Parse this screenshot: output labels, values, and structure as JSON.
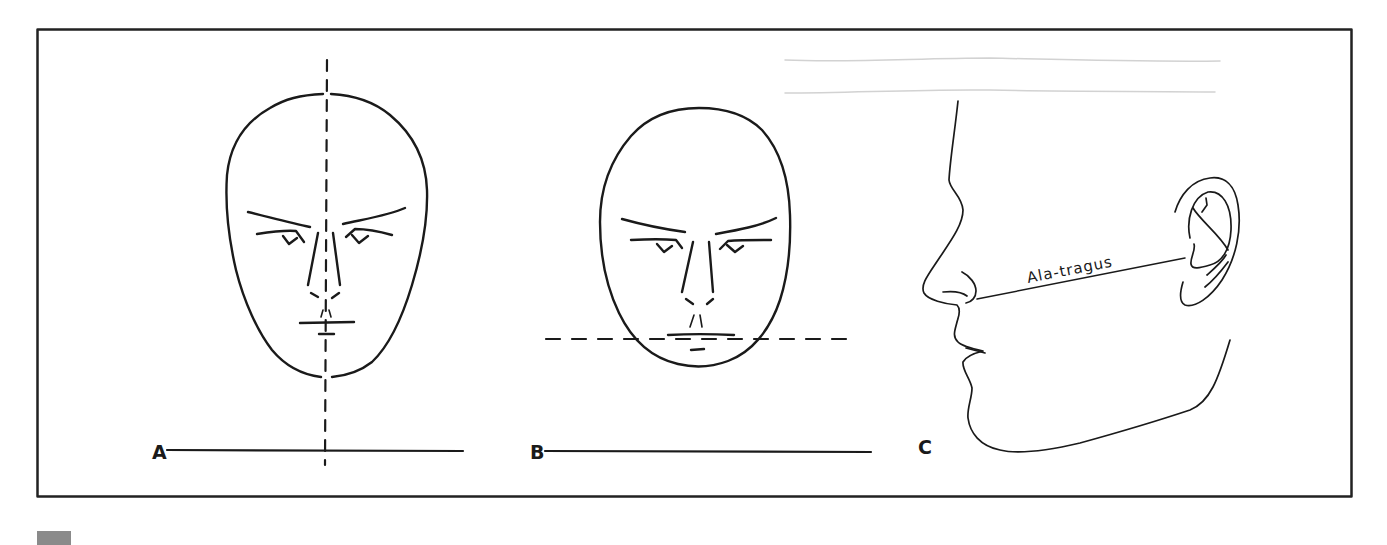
{
  "figure": {
    "panels": [
      {
        "id": "A",
        "label": "A",
        "description": "Frontal view of face with vertical dashed midline (facial midline)",
        "reference_line": "vertical dashed midline"
      },
      {
        "id": "B",
        "label": "B",
        "description": "Frontal view of face with horizontal dashed line at the lip level (interpupillary/occlusal plane parallel)",
        "reference_line": "horizontal dashed line"
      },
      {
        "id": "C",
        "label": "C",
        "description": "Profile view of face showing line from ala of nose to tragus of ear",
        "reference_line": "Ala-tragus line",
        "annotation": "Ala-tragus"
      }
    ],
    "colors": {
      "ink": "#1a1a1a",
      "frame": "#222222",
      "faint_guide": "#cfcfcf",
      "tab": "#8a8a8a",
      "background": "#ffffff"
    }
  }
}
